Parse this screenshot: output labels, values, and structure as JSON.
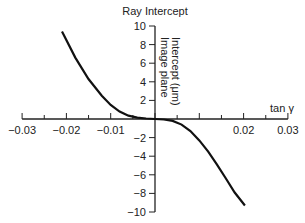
{
  "chart_data": {
    "type": "line",
    "title": "Ray Intercept",
    "xlabel": "tan γ",
    "ylabel": "Image plane Intercept (μm)",
    "xlim": [
      -0.03,
      0.03
    ],
    "ylim": [
      -10,
      10
    ],
    "x_ticks": [
      "-0.03",
      "-0.02",
      "-0.01",
      "0.02",
      "0.03"
    ],
    "y_ticks": [
      "10",
      "8",
      "6",
      "4",
      "2",
      "-2",
      "-4",
      "-6",
      "-8",
      "-10"
    ],
    "grid": false,
    "series": [
      {
        "name": "ray intercept",
        "x": [
          -0.021,
          -0.018,
          -0.015,
          -0.012,
          -0.01,
          -0.008,
          -0.006,
          -0.004,
          -0.002,
          0,
          0.002,
          0.004,
          0.006,
          0.008,
          0.01,
          0.012,
          0.014,
          0.016,
          0.018,
          0.0203
        ],
        "values": [
          9.4,
          6.6,
          4.3,
          2.5,
          1.5,
          0.8,
          0.35,
          0.15,
          0.05,
          0,
          -0.05,
          -0.2,
          -0.6,
          -1.3,
          -2.3,
          -3.5,
          -4.9,
          -6.4,
          -7.9,
          -9.3
        ]
      }
    ]
  }
}
